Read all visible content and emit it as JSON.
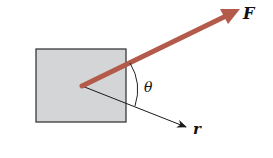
{
  "diagram": {
    "labels": {
      "force": "F",
      "position": "r",
      "angle": "θ"
    },
    "colors": {
      "block_fill": "#d3d5d6",
      "block_stroke": "#3a3a3a",
      "force_arrow": "#b35a4a",
      "r_arrow": "#1a1a1a"
    },
    "geometry": {
      "block": {
        "x": 36,
        "y": 49,
        "width": 90,
        "height": 73
      },
      "origin": {
        "x": 82,
        "y": 86
      },
      "force_tip": {
        "x": 238,
        "y": 10
      },
      "r_tip": {
        "x": 186,
        "y": 127
      }
    }
  }
}
